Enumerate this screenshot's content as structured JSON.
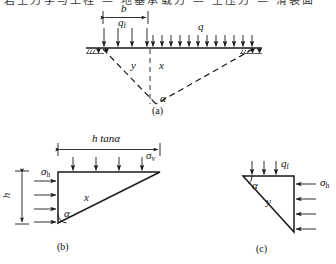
{
  "figure": {
    "clipped_header_text": "岩土力学与工程 — 地基承载力 — 土压力 — 滑裂面",
    "captions": {
      "a": "(a)",
      "b": "(b)",
      "c": "(c)"
    }
  },
  "panel_a": {
    "name": "ground-surface-loading-wedge",
    "labels": {
      "b": "b",
      "qf": "q",
      "qf_sub": "f",
      "q": "q",
      "y": "y",
      "x": "x",
      "alpha": "α"
    },
    "dimension_b": {
      "label": "b",
      "x_start": 103,
      "x_end": 148,
      "y": 16
    },
    "ground_line": {
      "y": 48,
      "x_start": 92,
      "x_end": 256
    },
    "load_arrows_qf": {
      "count": 4,
      "x_positions": [
        104,
        118,
        132,
        146
      ],
      "y_top": 28,
      "y_bottom": 47
    },
    "load_arrows_q": {
      "count": 12,
      "x_start": 152,
      "x_end": 251,
      "y_top": 34,
      "y_bottom": 47
    },
    "apex": {
      "x": 156,
      "y": 103
    },
    "wedge_left_top": {
      "x": 103,
      "y": 49
    },
    "wedge_right_top": {
      "x": 253,
      "y": 49
    }
  },
  "panel_b": {
    "name": "triangular-element-b",
    "labels": {
      "htan": "h tanα",
      "h": "h",
      "sigma_v": "σ",
      "sigma_v_sub": "v",
      "sigma_h": "σ",
      "sigma_h_sub": "h",
      "x": "x",
      "alpha": "α"
    },
    "triangle": {
      "top_left": {
        "x": 58,
        "y": 172
      },
      "top_right": {
        "x": 160,
        "y": 172
      },
      "bottom_left": {
        "x": 58,
        "y": 223
      }
    },
    "dimension_htan": {
      "x_start": 58,
      "x_end": 160,
      "y": 148
    },
    "dimension_h": {
      "x": 22,
      "y_start": 170,
      "y_end": 224
    },
    "arrows_sigma_v": {
      "count": 4,
      "x_positions": [
        73,
        96,
        119,
        142
      ],
      "y_top": 157,
      "y_bottom": 171
    },
    "arrows_sigma_h": {
      "count": 4,
      "y_positions": [
        181,
        195,
        209,
        222
      ],
      "x_start": 34,
      "x_end": 57
    }
  },
  "panel_c": {
    "name": "triangular-element-c",
    "labels": {
      "qf": "q",
      "qf_sub": "f",
      "sigma_h": "σ",
      "sigma_h_sub": "h",
      "y": "y",
      "alpha": "α"
    },
    "triangle": {
      "top_left": {
        "x": 243,
        "y": 176
      },
      "top_right": {
        "x": 294,
        "y": 176
      },
      "bottom_right": {
        "x": 294,
        "y": 232
      }
    },
    "arrows_qf": {
      "count": 3,
      "x_positions": [
        252,
        264,
        276
      ],
      "y_top": 161,
      "y_bottom": 175
    },
    "arrows_sigma_h": {
      "count": 4,
      "y_positions": [
        184,
        199,
        214,
        229
      ],
      "x_start": 318,
      "x_end": 296
    }
  },
  "style": {
    "stroke": "#1a1a1a",
    "background": "#ffffff"
  }
}
